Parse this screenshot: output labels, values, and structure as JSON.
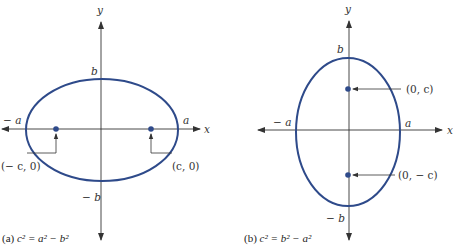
{
  "colors": {
    "ellipse": "#2e4a8a",
    "focus": "#2e4a8a",
    "axis": "#333333",
    "text": "#333333"
  },
  "panels": [
    {
      "id": "a",
      "caption_prefix": "(a) ",
      "caption_eq": "c² = a² − b²",
      "axis_x_label": "x",
      "axis_y_label": "y",
      "labels": {
        "b_top": "b",
        "b_bottom": "− b",
        "a_left": "− a",
        "a_right": "a"
      },
      "foci": [
        {
          "label": "(− c, 0)"
        },
        {
          "label": "(c, 0)"
        }
      ],
      "orientation": "horizontal major axis"
    },
    {
      "id": "b",
      "caption_prefix": "(b) ",
      "caption_eq": "c² = b² − a²",
      "axis_x_label": "x",
      "axis_y_label": "y",
      "labels": {
        "b_top": "b",
        "b_bottom": "− b",
        "a_left": "− a",
        "a_right": "a"
      },
      "foci": [
        {
          "label": "(0, c)"
        },
        {
          "label": "(0, − c)"
        }
      ],
      "orientation": "vertical major axis"
    }
  ]
}
